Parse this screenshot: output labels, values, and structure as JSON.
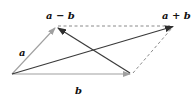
{
  "diagram": {
    "type": "vector-parallelogram",
    "labels": {
      "a": "a",
      "b": "b",
      "sum": "a + b",
      "difference": "a − b"
    },
    "points": {
      "origin": [
        12,
        74
      ],
      "a_tip": [
        56,
        27
      ],
      "b_tip": [
        131,
        74
      ],
      "sum_tip": [
        174,
        26
      ]
    },
    "colors": {
      "basis_vectors": "#a0a0a0",
      "result_vectors": "#3a3a3a",
      "dashed": "#8a8a8a",
      "text": "#111111"
    }
  }
}
